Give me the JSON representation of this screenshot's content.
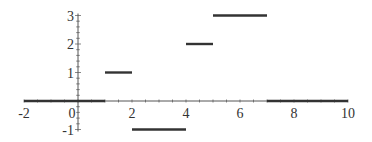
{
  "chart_data": {
    "type": "line",
    "subtype": "piecewise-constant step function",
    "title": "",
    "xlabel": "",
    "ylabel": "",
    "xlim": [
      -2,
      10
    ],
    "ylim": [
      -1,
      3
    ],
    "x_ticks": [
      -2,
      0,
      2,
      4,
      6,
      8,
      10
    ],
    "x_tick_labels": [
      "-2",
      "0",
      "2",
      "4",
      "6",
      "8",
      "10"
    ],
    "y_ticks": [
      -1,
      1,
      2,
      3
    ],
    "y_tick_labels": [
      "-1",
      "1",
      "2",
      "3"
    ],
    "grid": false,
    "legend": null,
    "segments": [
      {
        "x_start": -2,
        "x_end": 1,
        "y": 0
      },
      {
        "x_start": 1,
        "x_end": 2,
        "y": 1
      },
      {
        "x_start": 2,
        "x_end": 4,
        "y": -1
      },
      {
        "x_start": 4,
        "x_end": 5,
        "y": 2
      },
      {
        "x_start": 5,
        "x_end": 7,
        "y": 3
      },
      {
        "x_start": 7,
        "x_end": 10,
        "y": 0
      }
    ],
    "colors": {
      "line": "#333333",
      "axis": "#555555",
      "text": "#333333"
    }
  }
}
